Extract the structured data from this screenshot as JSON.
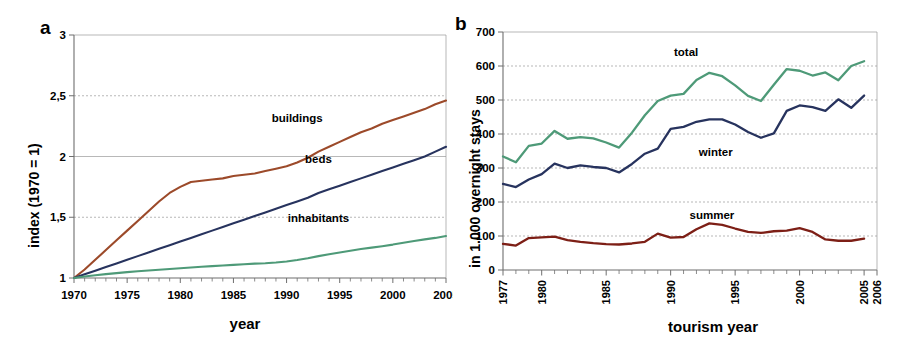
{
  "figure": {
    "panels": [
      {
        "letter": "a",
        "ylabel": "index (1970 = 1)",
        "xlabel": "year"
      },
      {
        "letter": "b",
        "ylabel": "in 1.000 overnight stays",
        "xlabel": "tourism year"
      }
    ]
  },
  "chart_data": [
    {
      "type": "line",
      "panel": "a",
      "title": "",
      "xlabel": "year",
      "ylabel": "index (1970 = 1)",
      "xlim": [
        1970,
        2005
      ],
      "ylim": [
        1,
        3
      ],
      "xticks": [
        1970,
        1975,
        1980,
        1985,
        1990,
        1995,
        2000,
        2005
      ],
      "xticklabels": [
        "1970",
        "1975",
        "1980",
        "1985",
        "1990",
        "1995",
        "2000",
        "2005"
      ],
      "yticks": [
        1,
        1.5,
        2,
        2.5,
        3
      ],
      "yticklabels": [
        "1",
        "1,5",
        "2",
        "2,5",
        "3"
      ],
      "grid": "horizontal",
      "legend_position": "inline-annotation",
      "series": [
        {
          "name": "buildings",
          "color": "#9c4a2a",
          "label_x": 1991,
          "label_y": 2.28,
          "x": [
            1970,
            1971,
            1972,
            1973,
            1974,
            1975,
            1976,
            1977,
            1978,
            1979,
            1980,
            1981,
            1982,
            1983,
            1984,
            1985,
            1986,
            1987,
            1988,
            1989,
            1990,
            1991,
            1992,
            1993,
            1994,
            1995,
            1996,
            1997,
            1998,
            1999,
            2000,
            2001,
            2002,
            2003,
            2004,
            2005
          ],
          "values": [
            1.0,
            1.07,
            1.15,
            1.23,
            1.31,
            1.39,
            1.47,
            1.55,
            1.63,
            1.7,
            1.75,
            1.79,
            1.8,
            1.81,
            1.82,
            1.84,
            1.85,
            1.86,
            1.88,
            1.9,
            1.92,
            1.95,
            1.99,
            2.04,
            2.08,
            2.12,
            2.16,
            2.2,
            2.23,
            2.27,
            2.3,
            2.33,
            2.36,
            2.39,
            2.43,
            2.46
          ]
        },
        {
          "name": "beds",
          "color": "#27335e",
          "label_x": 1993,
          "label_y": 1.95,
          "x": [
            1970,
            1971,
            1972,
            1973,
            1974,
            1975,
            1976,
            1977,
            1978,
            1979,
            1980,
            1981,
            1982,
            1983,
            1984,
            1985,
            1986,
            1987,
            1988,
            1989,
            1990,
            1991,
            1992,
            1993,
            1994,
            1995,
            1996,
            1997,
            1998,
            1999,
            2000,
            2001,
            2002,
            2003,
            2004,
            2005
          ],
          "values": [
            1.0,
            1.03,
            1.06,
            1.09,
            1.12,
            1.15,
            1.18,
            1.21,
            1.24,
            1.27,
            1.3,
            1.33,
            1.36,
            1.39,
            1.42,
            1.45,
            1.48,
            1.51,
            1.54,
            1.57,
            1.6,
            1.63,
            1.66,
            1.7,
            1.73,
            1.76,
            1.79,
            1.82,
            1.85,
            1.88,
            1.91,
            1.94,
            1.97,
            2.0,
            2.04,
            2.08
          ]
        },
        {
          "name": "inhabitants",
          "color": "#4e9a78",
          "label_x": 1993,
          "label_y": 1.46,
          "x": [
            1970,
            1971,
            1972,
            1973,
            1974,
            1975,
            1976,
            1977,
            1978,
            1979,
            1980,
            1981,
            1982,
            1983,
            1984,
            1985,
            1986,
            1987,
            1988,
            1989,
            1990,
            1991,
            1992,
            1993,
            1994,
            1995,
            1996,
            1997,
            1998,
            1999,
            2000,
            2001,
            2002,
            2003,
            2004,
            2005
          ],
          "values": [
            1.0,
            1.012,
            1.022,
            1.032,
            1.04,
            1.048,
            1.055,
            1.062,
            1.068,
            1.074,
            1.08,
            1.086,
            1.092,
            1.098,
            1.103,
            1.108,
            1.113,
            1.118,
            1.122,
            1.128,
            1.136,
            1.148,
            1.163,
            1.18,
            1.196,
            1.21,
            1.224,
            1.238,
            1.25,
            1.262,
            1.275,
            1.29,
            1.305,
            1.318,
            1.33,
            1.345
          ]
        }
      ]
    },
    {
      "type": "line",
      "panel": "b",
      "title": "",
      "xlabel": "tourism year",
      "ylabel": "in 1.000 overnight stays",
      "xlim": [
        1977,
        2006
      ],
      "ylim": [
        0,
        700
      ],
      "xticks": [
        1977,
        1980,
        1985,
        1990,
        1995,
        2000,
        2005,
        2006
      ],
      "xticklabels": [
        "1977",
        "1980",
        "1985",
        "1990",
        "1995",
        "2000",
        "2005",
        "2006"
      ],
      "yticks": [
        0,
        100,
        200,
        300,
        400,
        500,
        600,
        700
      ],
      "yticklabels": [
        "0",
        "100",
        "200",
        "300",
        "400",
        "500",
        "600",
        "700"
      ],
      "grid": "horizontal",
      "legend_position": "inline-annotation",
      "series": [
        {
          "name": "total",
          "color": "#4e9a78",
          "label_x": 1991.2,
          "label_y": 628,
          "x": [
            1977,
            1978,
            1979,
            1980,
            1981,
            1982,
            1983,
            1984,
            1985,
            1986,
            1987,
            1988,
            1989,
            1990,
            1991,
            1992,
            1993,
            1994,
            1995,
            1996,
            1997,
            1998,
            1999,
            2000,
            2001,
            2002,
            2003,
            2004,
            2005
          ],
          "values": [
            334,
            317,
            365,
            372,
            409,
            386,
            391,
            387,
            375,
            360,
            404,
            455,
            497,
            513,
            518,
            559,
            580,
            570,
            543,
            512,
            497,
            545,
            591,
            586,
            572,
            581,
            558,
            600,
            614,
            588
          ]
        },
        {
          "name": "winter",
          "color": "#27335e",
          "label_x": 1993.5,
          "label_y": 336,
          "x": [
            1977,
            1978,
            1979,
            1980,
            1981,
            1982,
            1983,
            1984,
            1985,
            1986,
            1987,
            1988,
            1989,
            1990,
            1991,
            1992,
            1993,
            1994,
            1995,
            1996,
            1997,
            1998,
            1999,
            2000,
            2001,
            2002,
            2003,
            2004,
            2005
          ],
          "values": [
            253,
            244,
            266,
            282,
            313,
            300,
            308,
            303,
            300,
            287,
            312,
            342,
            357,
            415,
            421,
            436,
            443,
            443,
            428,
            406,
            389,
            402,
            468,
            484,
            479,
            468,
            502,
            477,
            513,
            527,
            509,
            514
          ]
        },
        {
          "name": "summer",
          "color": "#7d1f16",
          "label_x": 1993.2,
          "label_y": 151,
          "x": [
            1977,
            1978,
            1979,
            1980,
            1981,
            1982,
            1983,
            1984,
            1985,
            1986,
            1987,
            1988,
            1989,
            1990,
            1991,
            1992,
            1993,
            1994,
            1995,
            1996,
            1997,
            1998,
            1999,
            2000,
            2001,
            2002,
            2003,
            2004,
            2005
          ],
          "values": [
            77,
            72,
            94,
            96,
            98,
            88,
            83,
            79,
            76,
            75,
            78,
            83,
            107,
            95,
            97,
            120,
            137,
            133,
            122,
            112,
            109,
            114,
            116,
            123,
            112,
            90,
            86,
            86,
            92,
            90,
            87
          ]
        }
      ]
    }
  ]
}
